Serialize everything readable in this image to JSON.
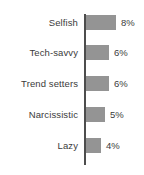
{
  "chart_data": {
    "type": "bar",
    "orientation": "horizontal",
    "title": "",
    "subtitle": "",
    "xlabel": "",
    "ylabel": "",
    "categories": [
      "Selfish",
      "Tech-savvy",
      "Trend setters",
      "Narcissistic",
      "Lazy"
    ],
    "values": [
      8,
      6,
      6,
      5,
      4
    ],
    "value_labels": [
      "8%",
      "6%",
      "6%",
      "5%",
      "4%"
    ],
    "unit": "%",
    "xlim": [
      0,
      8
    ],
    "grid": false,
    "legend": null,
    "legend_position": "none",
    "series": [
      {
        "name": "",
        "values": [
          8,
          6,
          6,
          5,
          4
        ]
      }
    ],
    "bars": [
      {
        "category": "Selfish",
        "value": 8,
        "label": "8%",
        "bar_px": 30
      },
      {
        "category": "Tech-savvy",
        "value": 6,
        "label": "6%",
        "bar_px": 23
      },
      {
        "category": "Trend setters",
        "value": 6,
        "label": "6%",
        "bar_px": 23
      },
      {
        "category": "Narcissistic",
        "value": 5,
        "label": "5%",
        "bar_px": 19
      },
      {
        "category": "Lazy",
        "value": 4,
        "label": "4%",
        "bar_px": 15
      }
    ],
    "colors": {
      "bar": "#949494",
      "axis": "#4d4d4d",
      "text": "#3b3b3b",
      "background": "#ffffff"
    }
  }
}
